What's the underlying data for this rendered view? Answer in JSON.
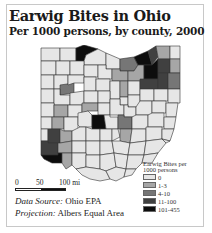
{
  "title": "Earwig Bites in Ohio",
  "subtitle": "Per 1000 persons, by county, 2000",
  "legend": {
    "title_line1": "Earwig Bites per",
    "title_line2": "1000 persons",
    "classes": [
      {
        "label": "0",
        "color": "#e6e6e6"
      },
      {
        "label": "1-3",
        "color": "#a6a6a6"
      },
      {
        "label": "4-10",
        "color": "#767676"
      },
      {
        "label": "11-100",
        "color": "#404040"
      },
      {
        "label": "101-455",
        "color": "#0d0d0d"
      }
    ]
  },
  "scale_bar": {
    "labels": [
      "0",
      "50",
      "100 mi"
    ]
  },
  "credits": {
    "source_label": "Data Source:",
    "source_value": "Ohio EPA",
    "projection_label": "Projection:",
    "projection_value": "Albers Equal Area"
  },
  "colors": {
    "border": "#333333",
    "frame": "#c8c8c8"
  }
}
